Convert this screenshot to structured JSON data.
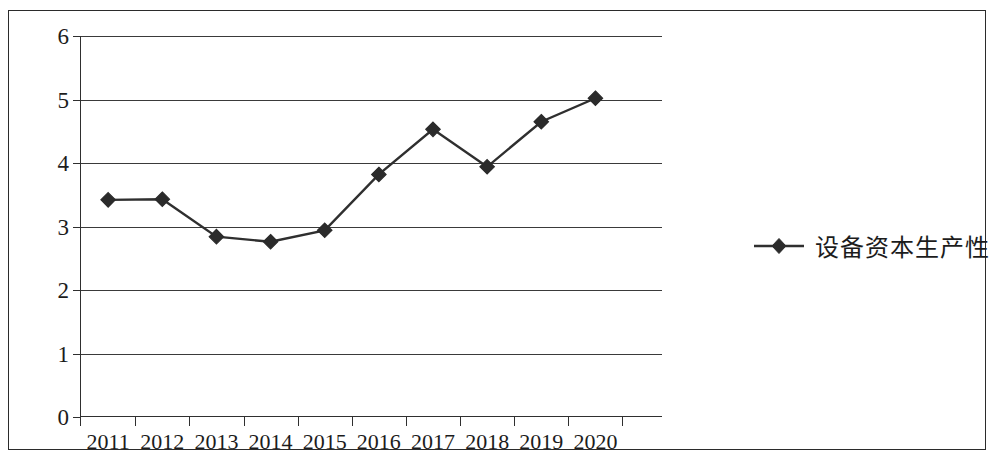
{
  "chart_data": {
    "type": "line",
    "title": "",
    "subtitle": "",
    "xlabel": "",
    "ylabel": "",
    "categories": [
      "2011",
      "2012",
      "2013",
      "2014",
      "2015",
      "2016",
      "2017",
      "2018",
      "2019",
      "2020"
    ],
    "series": [
      {
        "name": "设备资本生产性",
        "values": [
          3.42,
          3.43,
          2.84,
          2.76,
          2.94,
          3.82,
          4.53,
          3.94,
          4.65,
          5.02
        ],
        "marker": "diamond",
        "color": "#2f2f2f"
      }
    ],
    "ylim": [
      0,
      6
    ],
    "y_ticks": [
      0,
      1,
      2,
      3,
      4,
      5,
      6
    ],
    "y_tick_labels": [
      "0",
      "1",
      "2",
      "3",
      "4",
      "5",
      "6"
    ],
    "grid": true,
    "grid_axis": "y",
    "legend_position": "right",
    "legend_entries": [
      "设备资本生产性"
    ],
    "annotations": []
  },
  "legend": {
    "marker_icon": "diamond-marker-icon",
    "label": "设备资本生产性"
  },
  "colors": {
    "line": "#2f2f2f",
    "marker": "#2b2b2b",
    "grid": "#3a3a3a",
    "axis": "#2f2f2f",
    "frame": "#2b2b2b",
    "text": "#1c1c1c",
    "background": "#ffffff"
  }
}
